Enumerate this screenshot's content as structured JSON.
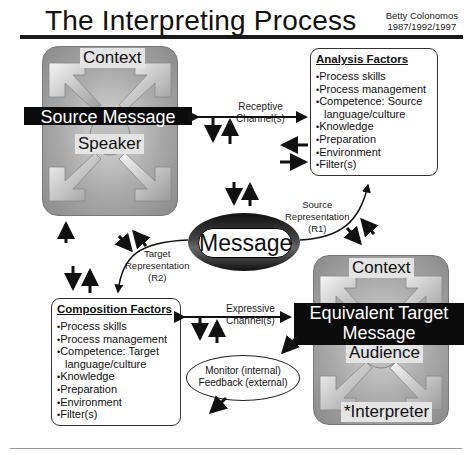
{
  "header": {
    "title": "The Interpreting Process",
    "author": "Betty Colonomos",
    "years": "1987/1992/1997"
  },
  "source_box": {
    "context_label": "Context",
    "message_label": "Source Message",
    "participant_label": "Speaker"
  },
  "target_box": {
    "context_label": "Context",
    "message_line1": "Equivalent Target",
    "message_line2": "Message",
    "participant_label": "Audience",
    "interpreter_label": "*Interpreter"
  },
  "analysis_factors": {
    "heading": "Analysis Factors",
    "items": [
      {
        "text": "Process skills",
        "cont": false
      },
      {
        "text": "Process management",
        "cont": false
      },
      {
        "text": "Competence: Source",
        "cont": false
      },
      {
        "text": "language/culture",
        "cont": true
      },
      {
        "text": "Knowledge",
        "cont": false
      },
      {
        "text": "Preparation",
        "cont": false
      },
      {
        "text": "Environment",
        "cont": false
      },
      {
        "text": "Filter(s)",
        "cont": false
      }
    ]
  },
  "composition_factors": {
    "heading": "Composition Factors",
    "items": [
      {
        "text": "Process skills",
        "cont": false
      },
      {
        "text": "Process management",
        "cont": false
      },
      {
        "text": "Competence: Target",
        "cont": false
      },
      {
        "text": "language/culture",
        "cont": true
      },
      {
        "text": "Knowledge",
        "cont": false
      },
      {
        "text": "Preparation",
        "cont": false
      },
      {
        "text": "Environment",
        "cont": false
      },
      {
        "text": "Filter(s)",
        "cont": false
      }
    ]
  },
  "center": {
    "message_label": "Message"
  },
  "channels": {
    "receptive_line1": "Receptive",
    "receptive_line2": "Channel(s)",
    "expressive_line1": "Expressive",
    "expressive_line2": "Channel(s)"
  },
  "representations": {
    "source_line1": "Source",
    "source_line2": "Representation",
    "source_line3": "(R1)",
    "target_line1": "Target",
    "target_line2": "Representation",
    "target_line3": "(R2)"
  },
  "monitor": {
    "line1": "Monitor (internal)",
    "line2": "Feedback (external)"
  }
}
